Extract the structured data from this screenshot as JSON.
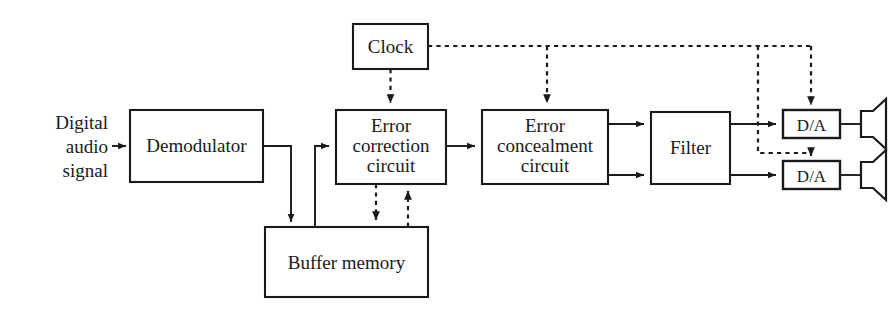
{
  "diagram": {
    "style": {
      "background": "#ffffff",
      "line_color": "#1a1a1a",
      "text_color": "#1a1a1a",
      "solid_line": "solid",
      "control_line": "dashed"
    },
    "input_label": {
      "line1": "Digital",
      "line2": "audio",
      "line3": "signal"
    },
    "blocks": [
      {
        "id": "clock",
        "label": "Clock",
        "lines": [
          "Clock"
        ]
      },
      {
        "id": "demodulator",
        "label": "Demodulator",
        "lines": [
          "Demodulator"
        ]
      },
      {
        "id": "error-correction",
        "label": "Error correction circuit",
        "lines": [
          "Error",
          "correction",
          "circuit"
        ]
      },
      {
        "id": "buffer-memory",
        "label": "Buffer memory",
        "lines": [
          "Buffer memory"
        ]
      },
      {
        "id": "error-concealment",
        "label": "Error concealment circuit",
        "lines": [
          "Error",
          "concealment",
          "circuit"
        ]
      },
      {
        "id": "filter",
        "label": "Filter",
        "lines": [
          "Filter"
        ]
      },
      {
        "id": "da-converter-top",
        "label": "D/A",
        "lines": [
          "D/A"
        ]
      },
      {
        "id": "da-converter-bottom",
        "label": "D/A",
        "lines": [
          "D/A"
        ]
      }
    ],
    "outputs": [
      {
        "id": "speaker-top",
        "label": "speaker"
      },
      {
        "id": "speaker-bottom",
        "label": "speaker"
      }
    ],
    "connections": [
      {
        "from": "input",
        "to": "demodulator",
        "type": "solid"
      },
      {
        "from": "demodulator",
        "to": "buffer-memory",
        "type": "solid"
      },
      {
        "from": "buffer-memory",
        "to": "error-correction",
        "type": "solid"
      },
      {
        "from": "error-correction",
        "to": "error-concealment",
        "type": "solid"
      },
      {
        "from": "error-concealment",
        "to": "filter",
        "type": "solid"
      },
      {
        "from": "error-concealment",
        "to": "filter",
        "type": "solid"
      },
      {
        "from": "filter",
        "to": "da-converter-top",
        "type": "solid"
      },
      {
        "from": "filter",
        "to": "da-converter-bottom",
        "type": "solid"
      },
      {
        "from": "da-converter-top",
        "to": "speaker-top",
        "type": "solid"
      },
      {
        "from": "da-converter-bottom",
        "to": "speaker-bottom",
        "type": "solid"
      },
      {
        "from": "clock",
        "to": "error-correction",
        "type": "dashed"
      },
      {
        "from": "clock",
        "to": "error-concealment",
        "type": "dashed"
      },
      {
        "from": "clock",
        "to": "da-converter-top",
        "type": "dashed"
      },
      {
        "from": "clock",
        "to": "da-converter-bottom",
        "type": "dashed"
      },
      {
        "from": "error-correction",
        "to": "buffer-memory",
        "type": "dashed"
      },
      {
        "from": "buffer-memory",
        "to": "error-correction",
        "type": "dashed"
      }
    ]
  }
}
